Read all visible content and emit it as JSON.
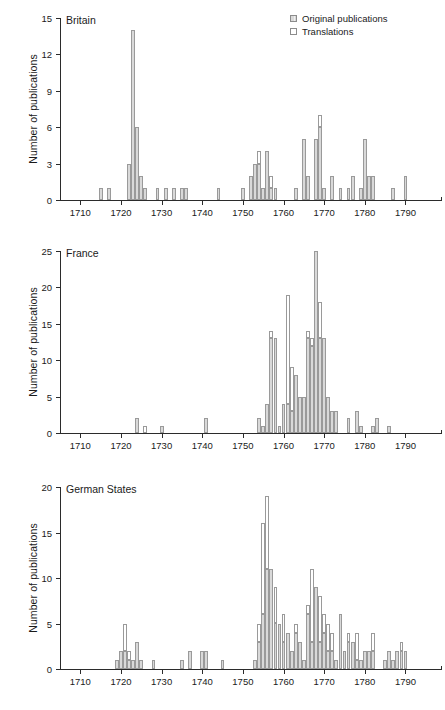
{
  "figure": {
    "background": "#ffffff",
    "axis_color": "#2b2b2b",
    "bar_fill_original": "#d9d9d9",
    "bar_fill_translation": "#ffffff",
    "bar_edge": "#9a9a9a"
  },
  "legend": {
    "position": "top-right-of-first-panel",
    "items": [
      {
        "label": "Original publications",
        "swatch": "hatched-gray"
      },
      {
        "label": "Translations",
        "swatch": "white"
      }
    ]
  },
  "chart_data": [
    {
      "type": "bar",
      "title": "Britain",
      "xlabel": "",
      "ylabel": "Number of publications",
      "xlim": [
        1705,
        1798
      ],
      "ylim": [
        0,
        15
      ],
      "yticks": [
        0,
        3,
        6,
        9,
        12,
        15
      ],
      "xticks": [
        1710,
        1720,
        1730,
        1740,
        1750,
        1760,
        1770,
        1780,
        1790
      ],
      "grid": false,
      "stacked": true,
      "series": [
        {
          "name": "Original publications",
          "fill": "#d9d9d9"
        },
        {
          "name": "Translations",
          "fill": "#ffffff"
        }
      ],
      "bars": [
        {
          "year": 1715,
          "original": 1,
          "translations": 0
        },
        {
          "year": 1717,
          "original": 1,
          "translations": 0
        },
        {
          "year": 1722,
          "original": 3,
          "translations": 0
        },
        {
          "year": 1723,
          "original": 14,
          "translations": 0
        },
        {
          "year": 1724,
          "original": 6,
          "translations": 0
        },
        {
          "year": 1725,
          "original": 2,
          "translations": 0
        },
        {
          "year": 1726,
          "original": 1,
          "translations": 0
        },
        {
          "year": 1729,
          "original": 1,
          "translations": 0
        },
        {
          "year": 1731,
          "original": 1,
          "translations": 0
        },
        {
          "year": 1733,
          "original": 1,
          "translations": 0
        },
        {
          "year": 1735,
          "original": 1,
          "translations": 0
        },
        {
          "year": 1736,
          "original": 1,
          "translations": 0
        },
        {
          "year": 1744,
          "original": 1,
          "translations": 0
        },
        {
          "year": 1750,
          "original": 1,
          "translations": 0
        },
        {
          "year": 1752,
          "original": 2,
          "translations": 0
        },
        {
          "year": 1753,
          "original": 3,
          "translations": 0
        },
        {
          "year": 1754,
          "original": 3,
          "translations": 1
        },
        {
          "year": 1755,
          "original": 1,
          "translations": 0
        },
        {
          "year": 1756,
          "original": 4,
          "translations": 0
        },
        {
          "year": 1757,
          "original": 1,
          "translations": 1
        },
        {
          "year": 1758,
          "original": 1,
          "translations": 0
        },
        {
          "year": 1763,
          "original": 1,
          "translations": 0
        },
        {
          "year": 1765,
          "original": 5,
          "translations": 0
        },
        {
          "year": 1766,
          "original": 2,
          "translations": 0
        },
        {
          "year": 1768,
          "original": 5,
          "translations": 0
        },
        {
          "year": 1769,
          "original": 6,
          "translations": 1
        },
        {
          "year": 1770,
          "original": 1,
          "translations": 0
        },
        {
          "year": 1772,
          "original": 2,
          "translations": 0
        },
        {
          "year": 1774,
          "original": 1,
          "translations": 0
        },
        {
          "year": 1776,
          "original": 1,
          "translations": 0
        },
        {
          "year": 1777,
          "original": 2,
          "translations": 0
        },
        {
          "year": 1779,
          "original": 1,
          "translations": 0
        },
        {
          "year": 1780,
          "original": 5,
          "translations": 0
        },
        {
          "year": 1781,
          "original": 2,
          "translations": 0
        },
        {
          "year": 1782,
          "original": 2,
          "translations": 0
        },
        {
          "year": 1787,
          "original": 1,
          "translations": 0
        },
        {
          "year": 1790,
          "original": 2,
          "translations": 0
        }
      ]
    },
    {
      "type": "bar",
      "title": "France",
      "xlabel": "",
      "ylabel": "Number of publications",
      "xlim": [
        1705,
        1798
      ],
      "ylim": [
        0,
        25
      ],
      "yticks": [
        0,
        5,
        10,
        15,
        20,
        25
      ],
      "xticks": [
        1710,
        1720,
        1730,
        1740,
        1750,
        1760,
        1770,
        1780,
        1790
      ],
      "grid": false,
      "stacked": true,
      "series": [
        {
          "name": "Original publications",
          "fill": "#d9d9d9"
        },
        {
          "name": "Translations",
          "fill": "#ffffff"
        }
      ],
      "bars": [
        {
          "year": 1724,
          "original": 2,
          "translations": 0
        },
        {
          "year": 1726,
          "original": 0,
          "translations": 1
        },
        {
          "year": 1730,
          "original": 1,
          "translations": 0
        },
        {
          "year": 1741,
          "original": 2,
          "translations": 0
        },
        {
          "year": 1754,
          "original": 2,
          "translations": 0
        },
        {
          "year": 1755,
          "original": 1,
          "translations": 0
        },
        {
          "year": 1756,
          "original": 4,
          "translations": 0
        },
        {
          "year": 1757,
          "original": 13,
          "translations": 1
        },
        {
          "year": 1758,
          "original": 13,
          "translations": 0
        },
        {
          "year": 1759,
          "original": 1,
          "translations": 0
        },
        {
          "year": 1760,
          "original": 4,
          "translations": 0
        },
        {
          "year": 1761,
          "original": 4,
          "translations": 15
        },
        {
          "year": 1762,
          "original": 3,
          "translations": 6
        },
        {
          "year": 1763,
          "original": 8,
          "translations": 0
        },
        {
          "year": 1764,
          "original": 5,
          "translations": 0
        },
        {
          "year": 1765,
          "original": 5,
          "translations": 0
        },
        {
          "year": 1766,
          "original": 13,
          "translations": 1
        },
        {
          "year": 1767,
          "original": 12,
          "translations": 1
        },
        {
          "year": 1768,
          "original": 25,
          "translations": 0
        },
        {
          "year": 1769,
          "original": 13,
          "translations": 5
        },
        {
          "year": 1770,
          "original": 13,
          "translations": 0
        },
        {
          "year": 1771,
          "original": 5,
          "translations": 0
        },
        {
          "year": 1772,
          "original": 3,
          "translations": 0
        },
        {
          "year": 1773,
          "original": 3,
          "translations": 0
        },
        {
          "year": 1776,
          "original": 2,
          "translations": 0
        },
        {
          "year": 1778,
          "original": 3,
          "translations": 0
        },
        {
          "year": 1779,
          "original": 1,
          "translations": 0
        },
        {
          "year": 1782,
          "original": 1,
          "translations": 0
        },
        {
          "year": 1783,
          "original": 2,
          "translations": 0
        },
        {
          "year": 1786,
          "original": 1,
          "translations": 0
        }
      ]
    },
    {
      "type": "bar",
      "title": "German States",
      "xlabel": "",
      "ylabel": "Number of publications",
      "xlim": [
        1705,
        1798
      ],
      "ylim": [
        0,
        20
      ],
      "yticks": [
        0,
        5,
        10,
        15,
        20
      ],
      "xticks": [
        1710,
        1720,
        1730,
        1740,
        1750,
        1760,
        1770,
        1780,
        1790
      ],
      "grid": false,
      "stacked": true,
      "series": [
        {
          "name": "Original publications",
          "fill": "#d9d9d9"
        },
        {
          "name": "Translations",
          "fill": "#ffffff"
        }
      ],
      "bars": [
        {
          "year": 1719,
          "original": 1,
          "translations": 0
        },
        {
          "year": 1720,
          "original": 2,
          "translations": 0
        },
        {
          "year": 1721,
          "original": 2,
          "translations": 3
        },
        {
          "year": 1722,
          "original": 1,
          "translations": 1
        },
        {
          "year": 1723,
          "original": 1,
          "translations": 0
        },
        {
          "year": 1724,
          "original": 3,
          "translations": 0
        },
        {
          "year": 1725,
          "original": 1,
          "translations": 0
        },
        {
          "year": 1728,
          "original": 1,
          "translations": 0
        },
        {
          "year": 1735,
          "original": 1,
          "translations": 0
        },
        {
          "year": 1737,
          "original": 2,
          "translations": 0
        },
        {
          "year": 1740,
          "original": 2,
          "translations": 0
        },
        {
          "year": 1741,
          "original": 2,
          "translations": 0
        },
        {
          "year": 1745,
          "original": 1,
          "translations": 0
        },
        {
          "year": 1753,
          "original": 1,
          "translations": 0
        },
        {
          "year": 1754,
          "original": 3,
          "translations": 2
        },
        {
          "year": 1755,
          "original": 6,
          "translations": 10
        },
        {
          "year": 1756,
          "original": 11,
          "translations": 8
        },
        {
          "year": 1757,
          "original": 11,
          "translations": 0
        },
        {
          "year": 1758,
          "original": 5,
          "translations": 4
        },
        {
          "year": 1759,
          "original": 5,
          "translations": 0
        },
        {
          "year": 1760,
          "original": 3,
          "translations": 3
        },
        {
          "year": 1761,
          "original": 4,
          "translations": 0
        },
        {
          "year": 1762,
          "original": 2,
          "translations": 0
        },
        {
          "year": 1763,
          "original": 4,
          "translations": 1
        },
        {
          "year": 1764,
          "original": 3,
          "translations": 0
        },
        {
          "year": 1765,
          "original": 1,
          "translations": 0
        },
        {
          "year": 1766,
          "original": 6,
          "translations": 1
        },
        {
          "year": 1767,
          "original": 3,
          "translations": 8
        },
        {
          "year": 1768,
          "original": 9,
          "translations": 0
        },
        {
          "year": 1769,
          "original": 3,
          "translations": 5
        },
        {
          "year": 1770,
          "original": 4,
          "translations": 2
        },
        {
          "year": 1771,
          "original": 2,
          "translations": 3
        },
        {
          "year": 1772,
          "original": 2,
          "translations": 2
        },
        {
          "year": 1773,
          "original": 1,
          "translations": 0
        },
        {
          "year": 1774,
          "original": 6,
          "translations": 0
        },
        {
          "year": 1775,
          "original": 2,
          "translations": 0
        },
        {
          "year": 1776,
          "original": 3,
          "translations": 1
        },
        {
          "year": 1777,
          "original": 3,
          "translations": 0
        },
        {
          "year": 1778,
          "original": 1,
          "translations": 3
        },
        {
          "year": 1779,
          "original": 1,
          "translations": 0
        },
        {
          "year": 1780,
          "original": 2,
          "translations": 0
        },
        {
          "year": 1781,
          "original": 2,
          "translations": 0
        },
        {
          "year": 1782,
          "original": 2,
          "translations": 2
        },
        {
          "year": 1785,
          "original": 1,
          "translations": 0
        },
        {
          "year": 1786,
          "original": 2,
          "translations": 0
        },
        {
          "year": 1787,
          "original": 1,
          "translations": 0
        },
        {
          "year": 1788,
          "original": 2,
          "translations": 0
        },
        {
          "year": 1789,
          "original": 2,
          "translations": 1
        },
        {
          "year": 1790,
          "original": 2,
          "translations": 0
        }
      ]
    }
  ]
}
